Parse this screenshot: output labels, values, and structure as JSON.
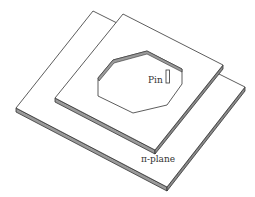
{
  "diagram": {
    "labels": {
      "pin": "Pin",
      "plane": "π-plane"
    },
    "colors": {
      "stroke": "#333333",
      "edge_fill": "#9a9a9a",
      "face_fill": "#ffffff"
    }
  }
}
